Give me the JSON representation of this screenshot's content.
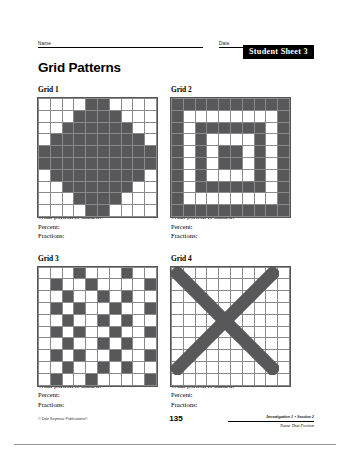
{
  "header": {
    "name_label": "Name",
    "date_label": "Date",
    "sheet_tag": "Student Sheet 3"
  },
  "title": "Grid Patterns",
  "prompt": {
    "question": "What portion is shaded?",
    "percent_label": "Percent:",
    "fractions_label": "Fractions:"
  },
  "footer": {
    "copyright": "© Dale Seymour Publications®",
    "page_number": "135",
    "investigation": "Investigation 1 • Session 2",
    "unit": "Name That Portion"
  },
  "colors": {
    "shaded": "#58585a",
    "grid_line": "#8a8a8a",
    "tag_bg": "#000000",
    "tag_text": "#ffffff"
  },
  "grids": [
    {
      "label": "Grid 1",
      "rows": 10,
      "cols": 10,
      "pattern_name": "circle-diamond",
      "cells": [
        [
          0,
          0,
          0,
          0,
          1,
          1,
          0,
          0,
          0,
          0
        ],
        [
          0,
          0,
          0,
          1,
          1,
          1,
          1,
          0,
          0,
          0
        ],
        [
          0,
          0,
          1,
          1,
          1,
          1,
          1,
          1,
          0,
          0
        ],
        [
          0,
          1,
          1,
          1,
          1,
          1,
          1,
          1,
          1,
          0
        ],
        [
          1,
          1,
          1,
          1,
          1,
          1,
          1,
          1,
          1,
          1
        ],
        [
          1,
          1,
          1,
          1,
          1,
          1,
          1,
          1,
          1,
          1
        ],
        [
          0,
          1,
          1,
          1,
          1,
          1,
          1,
          1,
          1,
          0
        ],
        [
          0,
          0,
          1,
          1,
          1,
          1,
          1,
          1,
          0,
          0
        ],
        [
          0,
          0,
          0,
          1,
          1,
          1,
          1,
          0,
          0,
          0
        ],
        [
          0,
          0,
          0,
          0,
          1,
          1,
          0,
          0,
          0,
          0
        ]
      ],
      "shaded_count": 76
    },
    {
      "label": "Grid 2",
      "rows": 10,
      "cols": 10,
      "pattern_name": "concentric-squares",
      "cells": [
        [
          1,
          1,
          1,
          1,
          1,
          1,
          1,
          1,
          1,
          1
        ],
        [
          1,
          0,
          0,
          0,
          0,
          0,
          0,
          0,
          0,
          1
        ],
        [
          1,
          0,
          1,
          1,
          1,
          1,
          1,
          1,
          0,
          1
        ],
        [
          1,
          0,
          1,
          0,
          0,
          0,
          0,
          1,
          0,
          1
        ],
        [
          1,
          0,
          1,
          0,
          1,
          1,
          0,
          1,
          0,
          1
        ],
        [
          1,
          0,
          1,
          0,
          1,
          1,
          0,
          1,
          0,
          1
        ],
        [
          1,
          0,
          1,
          0,
          0,
          0,
          0,
          1,
          0,
          1
        ],
        [
          1,
          0,
          1,
          1,
          1,
          1,
          1,
          1,
          0,
          1
        ],
        [
          1,
          0,
          0,
          0,
          0,
          0,
          0,
          0,
          0,
          1
        ],
        [
          1,
          1,
          1,
          1,
          1,
          1,
          1,
          1,
          1,
          1
        ]
      ],
      "shaded_count": 60
    },
    {
      "label": "Grid 3",
      "rows": 10,
      "cols": 10,
      "pattern_name": "scattered-checker",
      "cells": [
        [
          0,
          0,
          0,
          1,
          0,
          0,
          0,
          1,
          0,
          0
        ],
        [
          0,
          1,
          0,
          0,
          1,
          0,
          0,
          0,
          0,
          1
        ],
        [
          0,
          0,
          1,
          0,
          0,
          1,
          0,
          1,
          0,
          0
        ],
        [
          0,
          1,
          0,
          1,
          0,
          0,
          1,
          0,
          0,
          1
        ],
        [
          0,
          0,
          1,
          0,
          0,
          1,
          0,
          1,
          0,
          0
        ],
        [
          0,
          1,
          0,
          1,
          0,
          0,
          1,
          0,
          0,
          1
        ],
        [
          0,
          0,
          1,
          0,
          0,
          1,
          0,
          1,
          0,
          0
        ],
        [
          0,
          1,
          0,
          1,
          0,
          0,
          1,
          0,
          0,
          1
        ],
        [
          0,
          0,
          1,
          0,
          0,
          1,
          0,
          1,
          0,
          0
        ],
        [
          0,
          1,
          0,
          0,
          1,
          0,
          0,
          0,
          0,
          1
        ]
      ],
      "shaded_count": 31
    },
    {
      "label": "Grid 4",
      "rows": 10,
      "cols": 10,
      "pattern_name": "diagonal-x",
      "cells": [
        [
          1,
          1,
          0,
          0,
          0,
          0,
          0,
          0,
          1,
          1
        ],
        [
          1,
          1,
          1,
          0,
          0,
          0,
          0,
          1,
          1,
          1
        ],
        [
          0,
          1,
          1,
          1,
          0,
          0,
          1,
          1,
          1,
          0
        ],
        [
          0,
          0,
          1,
          1,
          1,
          1,
          1,
          1,
          0,
          0
        ],
        [
          0,
          0,
          0,
          1,
          1,
          1,
          1,
          0,
          0,
          0
        ],
        [
          0,
          0,
          0,
          1,
          1,
          1,
          1,
          0,
          0,
          0
        ],
        [
          0,
          0,
          1,
          1,
          1,
          1,
          1,
          1,
          0,
          0
        ],
        [
          0,
          1,
          1,
          1,
          0,
          0,
          1,
          1,
          1,
          0
        ],
        [
          1,
          1,
          1,
          0,
          0,
          0,
          0,
          1,
          1,
          1
        ],
        [
          1,
          1,
          0,
          0,
          0,
          0,
          0,
          0,
          1,
          1
        ]
      ],
      "shaded_count": 56
    }
  ]
}
